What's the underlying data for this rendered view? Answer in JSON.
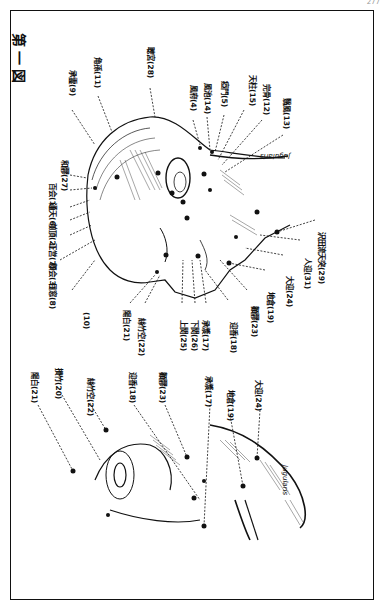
{
  "page": {
    "page_number": "277",
    "figure_title": "第一図"
  },
  "upper_figure": {
    "labels": [
      {
        "name": "承霊",
        "num": "(9)"
      },
      {
        "name": "角孫",
        "num": "(11)"
      },
      {
        "name": "聴宮",
        "num": "(28)"
      },
      {
        "name": "風府",
        "num": "(4)"
      },
      {
        "name": "風池",
        "num": "(14)"
      },
      {
        "name": "瘂門",
        "num": "(5)"
      },
      {
        "name": "天柱",
        "num": "(15)"
      },
      {
        "name": "完骨",
        "num": "(12)"
      },
      {
        "name": "翳風",
        "num": "(13)"
      },
      {
        "name": "和髎",
        "num": "(27)"
      },
      {
        "name": "百会",
        "num": "(1)"
      },
      {
        "name": "通天",
        "num": "(6)"
      },
      {
        "name": "前頂",
        "num": "(2)"
      },
      {
        "name": "正営",
        "num": "(7)"
      },
      {
        "name": "顖会",
        "num": "(3)"
      },
      {
        "name": "目窓",
        "num": "(8)"
      },
      {
        "name": "",
        "num": "(10)"
      },
      {
        "name": "陽白",
        "num": "(21)"
      },
      {
        "name": "絲竹空",
        "num": "(22)"
      },
      {
        "name": "上関",
        "num": "(25)"
      },
      {
        "name": "下関",
        "num": "(26)"
      },
      {
        "name": "承漿",
        "num": "(17)"
      },
      {
        "name": "迎香",
        "num": "(18)"
      },
      {
        "name": "顴髎",
        "num": "(23)"
      },
      {
        "name": "地倉",
        "num": "(19)"
      },
      {
        "name": "大迎",
        "num": "(24)"
      },
      {
        "name": "人迎",
        "num": "(31)"
      },
      {
        "name": "沢田流天突",
        "num": "(29)"
      }
    ],
    "neck_annotation": "Jugularis"
  },
  "lower_figure": {
    "labels": [
      {
        "name": "陽白",
        "num": "(21)"
      },
      {
        "name": "攅竹",
        "num": "(20)"
      },
      {
        "name": "絲竹空",
        "num": "(22)"
      },
      {
        "name": "迎香",
        "num": "(18)"
      },
      {
        "name": "顴髎",
        "num": "(23)"
      },
      {
        "name": "承漿",
        "num": "(17)"
      },
      {
        "name": "地倉",
        "num": "(19)"
      },
      {
        "name": "大迎",
        "num": "(24)"
      }
    ],
    "neck_annotation": "Jugularis"
  }
}
